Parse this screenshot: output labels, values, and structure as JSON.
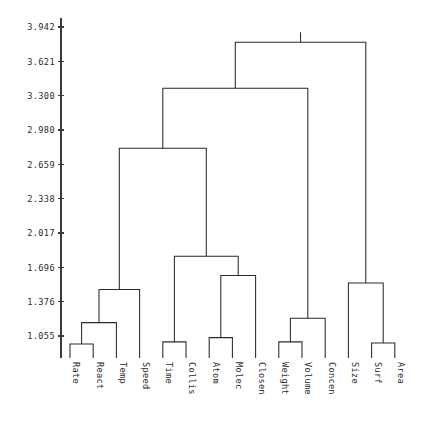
{
  "chart_data": {
    "type": "dendrogram",
    "title": "",
    "subtitle": "",
    "xlabel": "",
    "ylabel": "",
    "orientation": "vertical",
    "grid": false,
    "legend": null,
    "labels": [
      "Rate",
      "React",
      "Temp",
      "Speed",
      "Time",
      "Collis",
      "Atom",
      "Molec",
      "Closen",
      "Weight",
      "Volume",
      "Concen",
      "Size",
      "Surf",
      "Area"
    ],
    "leaf_order": [
      "Rate",
      "React",
      "Temp",
      "Speed",
      "Time",
      "Collis",
      "Atom",
      "Molec",
      "Closen",
      "Weight",
      "Volume",
      "Concen",
      "Size",
      "Surf",
      "Area"
    ],
    "yticks": [
      "1.055",
      "1.376",
      "1.696",
      "2.017",
      "2.338",
      "2.659",
      "2.980",
      "3.300",
      "3.621",
      "3.942"
    ],
    "ytick_values": [
      1.055,
      1.376,
      1.696,
      2.017,
      2.338,
      2.659,
      2.98,
      3.3,
      3.621,
      3.942
    ],
    "ylim": [
      0.86,
      4.02
    ],
    "axis_baseline": 0.86,
    "merges": [
      {
        "id": "m1",
        "left": "Rate",
        "right": "React",
        "height": 0.98
      },
      {
        "id": "m2",
        "left": "m1",
        "right": "Temp",
        "height": 1.18
      },
      {
        "id": "m3",
        "left": "Time",
        "right": "Collis",
        "height": 1.0
      },
      {
        "id": "m4",
        "left": "Atom",
        "right": "Molec",
        "height": 1.04
      },
      {
        "id": "m5",
        "left": "Weight",
        "right": "Volume",
        "height": 1.0
      },
      {
        "id": "m6",
        "left": "Surf",
        "right": "Area",
        "height": 0.99
      },
      {
        "id": "m7",
        "left": "m2",
        "right": "Speed",
        "height": 1.49
      },
      {
        "id": "m8",
        "left": "m4",
        "right": "Closen",
        "height": 1.62
      },
      {
        "id": "m9",
        "left": "m5",
        "right": "Concen",
        "height": 1.22
      },
      {
        "id": "m10",
        "left": "m6",
        "right": "Size",
        "height": 1.55
      },
      {
        "id": "m11",
        "left": "m3",
        "right": "m8",
        "height": 1.8
      },
      {
        "id": "m12",
        "left": "m7",
        "right": "m11",
        "height": 2.81
      },
      {
        "id": "m13",
        "left": "m12",
        "right": "m9",
        "height": 3.37
      },
      {
        "id": "m14",
        "left": "m13",
        "right": "m10",
        "height": 3.8
      }
    ],
    "root": "m14",
    "colors": {
      "link": "#2a2a2a",
      "axis": "#3a3a3a",
      "text": "#2b2b2b",
      "background": "#ffffff"
    }
  }
}
